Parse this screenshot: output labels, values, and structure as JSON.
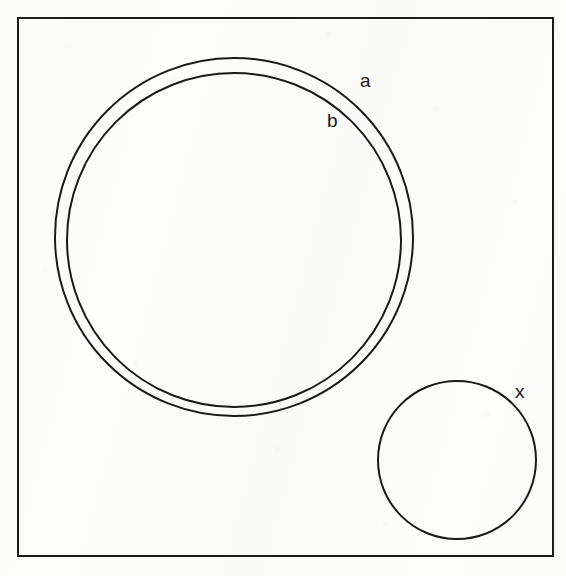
{
  "figure": {
    "kind": "line-drawing",
    "background_color": "#fdfdfc",
    "ink_color": "#1a1a1a",
    "frame": {
      "name": "border-rectangle",
      "x": 18,
      "y": 18,
      "width": 535,
      "height": 538,
      "stroke_width": 2
    },
    "shapes": [
      {
        "id": "outer-ring-circle",
        "role": "large circle outer wall",
        "label": "a",
        "cx": 234,
        "cy": 237,
        "r": 179,
        "stroke_width": 2
      },
      {
        "id": "inner-ring-circle",
        "role": "large circle inner wall",
        "label": "b",
        "cx": 234,
        "cy": 240,
        "r": 167,
        "stroke_width": 2
      },
      {
        "id": "small-circle",
        "role": "small circle",
        "label": "x",
        "cx": 457,
        "cy": 460,
        "r": 79,
        "stroke_width": 2
      }
    ],
    "labels": [
      {
        "id": "label-a",
        "text": "a",
        "x": 367,
        "y": 82,
        "refers_to": "outer-ring-circle"
      },
      {
        "id": "label-b",
        "text": "b",
        "x": 334,
        "y": 122,
        "refers_to": "inner-ring-circle"
      },
      {
        "id": "label-x",
        "text": "x",
        "x": 521,
        "y": 392,
        "refers_to": "small-circle"
      }
    ]
  }
}
